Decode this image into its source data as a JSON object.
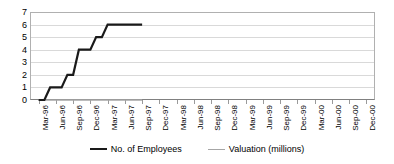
{
  "chart_data": {
    "type": "line",
    "title": "",
    "xlabel": "",
    "ylabel": "",
    "ylim": [
      0,
      7
    ],
    "yticks": [
      0,
      1,
      2,
      3,
      4,
      5,
      6,
      7
    ],
    "grid": true,
    "legend_position": "bottom",
    "categories": [
      "Mar-96",
      "Jun-96",
      "Sep-96",
      "Dec-96",
      "Mar-97",
      "Jun-97",
      "Sep-97",
      "Dec-97",
      "Mar-98",
      "Jun-98",
      "Sep-98",
      "Dec-98",
      "Mar-99",
      "Jun-99",
      "Sep-99",
      "Dec-99",
      "Mar-00",
      "Jun-00",
      "Sep-00",
      "Dec-00"
    ],
    "series": [
      {
        "name": "No. of Employees",
        "color": "#1a1a1a",
        "values": [
          0,
          1,
          2,
          4,
          5,
          6,
          6,
          null,
          null,
          null,
          null,
          null,
          null,
          null,
          null,
          null,
          null,
          null,
          null,
          null
        ],
        "step_points": [
          {
            "x": "Mar-96",
            "y": 0
          },
          {
            "x": "Apr-96",
            "y": 0
          },
          {
            "x": "May-96",
            "y": 1
          },
          {
            "x": "Jun-96",
            "y": 1
          },
          {
            "x": "Jul-96",
            "y": 1
          },
          {
            "x": "Aug-96",
            "y": 2
          },
          {
            "x": "Sep-96",
            "y": 2
          },
          {
            "x": "Oct-96",
            "y": 4
          },
          {
            "x": "Nov-96",
            "y": 4
          },
          {
            "x": "Dec-96",
            "y": 4
          },
          {
            "x": "Jan-97",
            "y": 5
          },
          {
            "x": "Feb-97",
            "y": 5
          },
          {
            "x": "Mar-97",
            "y": 6
          },
          {
            "x": "Sep-97",
            "y": 6
          }
        ]
      },
      {
        "name": "Valuation (millions)",
        "color": "#a6a6a6",
        "values": [
          0,
          0,
          0,
          0,
          0,
          0,
          0,
          null,
          null,
          null,
          null,
          null,
          null,
          null,
          null,
          null,
          null,
          null,
          null,
          null
        ]
      }
    ]
  },
  "legend": {
    "items": [
      {
        "label": "No. of Employees",
        "color": "#1a1a1a",
        "width": "2.5px"
      },
      {
        "label": "Valuation (millions)",
        "color": "#a6a6a6",
        "width": "1.5px"
      }
    ]
  },
  "axes": {
    "y_tick_labels": [
      "7",
      "6",
      "5",
      "4",
      "3",
      "2",
      "1",
      "0"
    ],
    "x_tick_labels": [
      "Mar-96",
      "Jun-96",
      "Sep-96",
      "Dec-96",
      "Mar-97",
      "Jun-97",
      "Sep-97",
      "Dec-97",
      "Mar-98",
      "Jun-98",
      "Sep-98",
      "Dec-98",
      "Mar-99",
      "Jun-99",
      "Sep-99",
      "Dec-99",
      "Mar-00",
      "Jun-00",
      "Sep-00",
      "Dec-00"
    ]
  }
}
